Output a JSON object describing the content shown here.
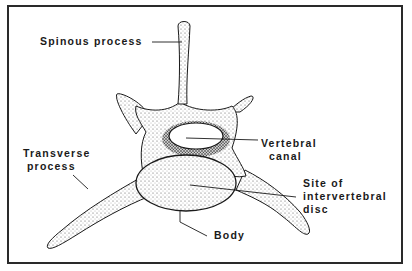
{
  "diagram": {
    "labels": {
      "spinous_process": "Spinous process",
      "vertebral_canal": [
        "Vertebral",
        "canal"
      ],
      "transverse_process": [
        "Transverse",
        "process"
      ],
      "site_of_disc": [
        "Site of",
        "intervertebral",
        "disc"
      ],
      "body": "Body"
    },
    "colors": {
      "ink": "#1a1a1a",
      "frame": "#2a2a2a",
      "background": "#ffffff",
      "stipple": "#555555"
    }
  }
}
